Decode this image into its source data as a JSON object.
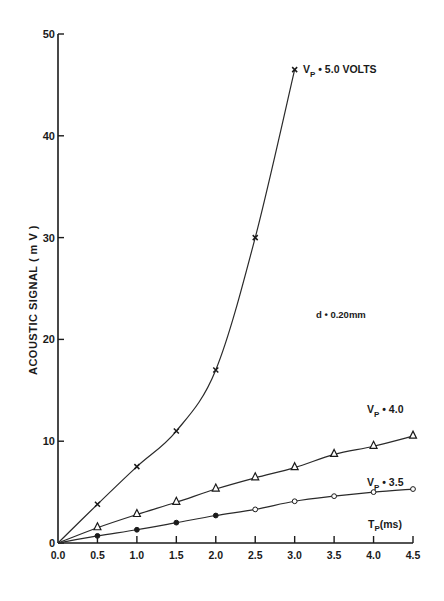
{
  "chart_data": {
    "type": "line",
    "title": "",
    "xlabel": "Tp(ms)",
    "ylabel": "ACOUSTIC SIGNAL (mV)",
    "xlim": [
      0.0,
      4.5
    ],
    "ylim": [
      0,
      50
    ],
    "grid": false,
    "x_ticks": [
      "0.0",
      "0.5",
      "1.0",
      "1.5",
      "2.0",
      "2.5",
      "3.0",
      "3.5",
      "4.0",
      "4.5"
    ],
    "y_ticks": [
      "0",
      "10",
      "20",
      "30",
      "40",
      "50"
    ],
    "annotations": [
      "d=0.20mm"
    ],
    "series": [
      {
        "name": "Vp = 5.0 VOLTS",
        "marker": "x",
        "x": [
          0.0,
          0.5,
          1.0,
          1.5,
          2.0,
          2.5,
          3.0
        ],
        "values": [
          0,
          3.8,
          7.5,
          11.0,
          17.0,
          30.0,
          46.5
        ]
      },
      {
        "name": "Vp = 4.0",
        "marker": "triangle",
        "x": [
          0.0,
          0.5,
          1.0,
          1.5,
          2.0,
          2.5,
          3.0,
          3.5,
          4.0,
          4.5
        ],
        "values": [
          0,
          1.5,
          2.8,
          4.0,
          5.3,
          6.4,
          7.4,
          8.7,
          9.5,
          10.5
        ]
      },
      {
        "name": "Vp = 3.5",
        "marker": "circle",
        "x": [
          0.0,
          0.5,
          1.0,
          1.5,
          2.0,
          2.5,
          3.0,
          3.5,
          4.0,
          4.5
        ],
        "values": [
          0,
          0.7,
          1.3,
          2.0,
          2.7,
          3.3,
          4.1,
          4.6,
          5.0,
          5.3
        ]
      }
    ]
  },
  "labels": {
    "y_axis": "ACOUSTIC  SIGNAL  ( m V )",
    "x_axis": "Tp(ms)",
    "series_5": "Vp = 5.0 VOLTS",
    "series_4": "Vp = 4.0",
    "series_35": "Vp = 3.5",
    "annotation": "d = 0.20mm"
  }
}
